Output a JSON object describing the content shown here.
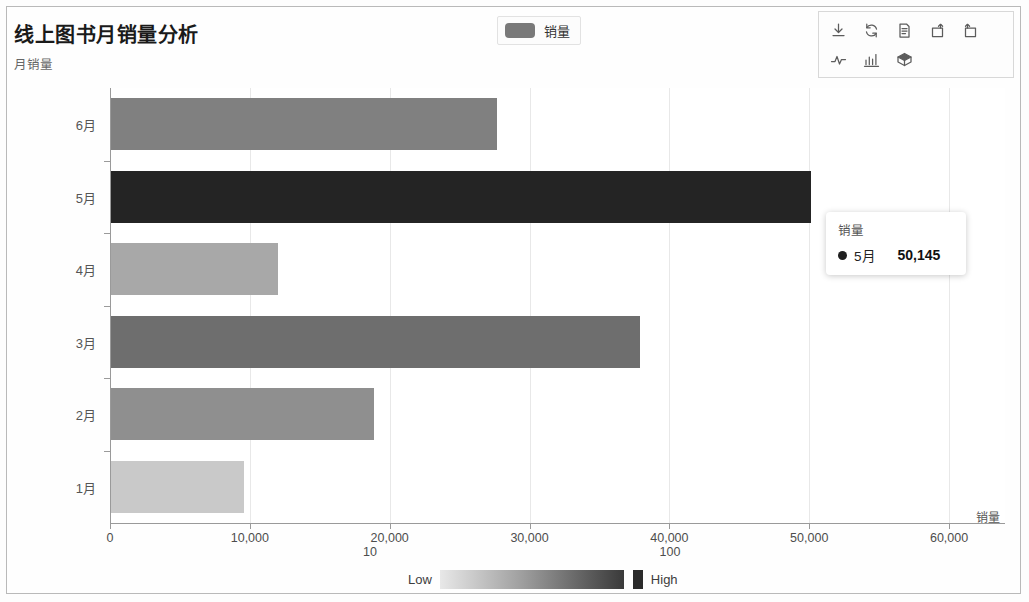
{
  "header": {
    "title": "线上图书月销量分析",
    "y_axis_title": "月销量"
  },
  "legend": {
    "label": "销量",
    "swatch_color": "#797979"
  },
  "toolbar": {
    "icons": [
      {
        "name": "download-icon",
        "label": "下载"
      },
      {
        "name": "refresh-icon",
        "label": "刷新"
      },
      {
        "name": "document-icon",
        "label": "数据"
      },
      {
        "name": "redo-icon",
        "label": "重做"
      },
      {
        "name": "undo-icon",
        "label": "撤销"
      },
      {
        "name": "line-chart-icon",
        "label": "折线图"
      },
      {
        "name": "bar-chart-icon",
        "label": "柱状图"
      },
      {
        "name": "cube-icon",
        "label": "三维图"
      }
    ]
  },
  "tooltip": {
    "title": "销量",
    "category": "5月",
    "value": "50,145",
    "dot_color": "#1f1f1f"
  },
  "gradient_legend": {
    "low_label": "Low",
    "high_label": "High",
    "low_color": "#e8e8e8",
    "high_color": "#2b2b2b"
  },
  "x_axis": {
    "title": "销量",
    "ticks": [
      "0",
      "10,000",
      "20,000",
      "30,000",
      "40,000",
      "50,000",
      "60,000"
    ],
    "sub_ticks": [
      "10",
      "100"
    ]
  },
  "chart_data": {
    "type": "bar",
    "orientation": "horizontal",
    "title": "线上图书月销量分析",
    "xlabel": "销量",
    "ylabel": "月销量",
    "categories": [
      "1月",
      "2月",
      "3月",
      "4月",
      "5月",
      "6月"
    ],
    "values": [
      9600,
      18900,
      37900,
      12000,
      50145,
      27700
    ],
    "bar_colors": [
      "#c9c9c9",
      "#8f8f8f",
      "#6e6e6e",
      "#a8a8a8",
      "#242424",
      "#808080"
    ],
    "xlim": [
      0,
      64000
    ],
    "xticks": [
      0,
      10000,
      20000,
      30000,
      40000,
      50000,
      60000
    ],
    "xticklabels": [
      "0",
      "10,000",
      "20,000",
      "30,000",
      "40,000",
      "50,000",
      "60,000"
    ],
    "grid": true,
    "legend": {
      "position": "top-center",
      "entries": [
        "销量"
      ]
    },
    "colorbar": {
      "low": "Low",
      "high": "High"
    },
    "highlighted": {
      "category": "5月",
      "value": 50145
    }
  }
}
